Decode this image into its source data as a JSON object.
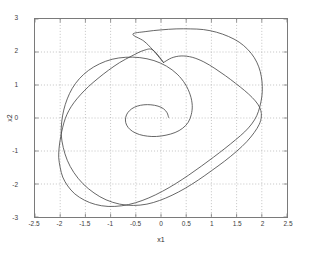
{
  "figure": {
    "background_color": "#ffffff",
    "axes_color": "#7a7a7a",
    "grid_color": "#9a9a9a",
    "curve_color": "#4a4a4a",
    "text_color": "#3c3c3c"
  },
  "chart_data": {
    "type": "line",
    "title": "",
    "xlabel": "x1",
    "ylabel": "x2",
    "xlim": [
      -2.5,
      2.5
    ],
    "ylim": [
      -3,
      3
    ],
    "xticks": [
      -2.5,
      -2,
      -1.5,
      -1,
      -0.5,
      0,
      0.5,
      1,
      1.5,
      2,
      2.5
    ],
    "xtick_labels": [
      "-2.5",
      "-2",
      "-1.5",
      "-1",
      "-0.5",
      "0",
      "0.5",
      "1",
      "1.5",
      "2",
      "2.5"
    ],
    "yticks": [
      -3,
      -2,
      -1,
      0,
      1,
      2,
      3
    ],
    "ytick_labels": [
      "-3",
      "-2",
      "-1",
      "0",
      "1",
      "2",
      "3"
    ],
    "grid": true,
    "grid_style": "dotted",
    "legend": null,
    "legend_position": "none",
    "series": [
      {
        "name": "trajectory-spiral-outward",
        "comment": "Single trajectory starting near (0.15, 0), spiralling counter-clockwise outward onto the limit cycle.",
        "points": [
          [
            0.15,
            0.02
          ],
          [
            0.12,
            0.16
          ],
          [
            0.05,
            0.28
          ],
          [
            -0.06,
            0.36
          ],
          [
            -0.2,
            0.4
          ],
          [
            -0.34,
            0.4
          ],
          [
            -0.47,
            0.36
          ],
          [
            -0.58,
            0.28
          ],
          [
            -0.66,
            0.16
          ],
          [
            -0.7,
            0.02
          ],
          [
            -0.7,
            -0.14
          ],
          [
            -0.65,
            -0.29
          ],
          [
            -0.56,
            -0.41
          ],
          [
            -0.43,
            -0.5
          ],
          [
            -0.27,
            -0.55
          ],
          [
            -0.09,
            -0.56
          ],
          [
            0.1,
            -0.52
          ],
          [
            0.28,
            -0.44
          ],
          [
            0.43,
            -0.31
          ],
          [
            0.54,
            -0.13
          ],
          [
            0.6,
            0.1
          ],
          [
            0.62,
            0.38
          ],
          [
            0.58,
            0.7
          ],
          [
            0.48,
            1.03
          ],
          [
            0.32,
            1.33
          ],
          [
            0.11,
            1.57
          ],
          [
            -0.14,
            1.74
          ],
          [
            -0.42,
            1.83
          ],
          [
            -0.7,
            1.84
          ],
          [
            -0.97,
            1.78
          ],
          [
            -1.22,
            1.64
          ],
          [
            -1.44,
            1.44
          ],
          [
            -1.62,
            1.19
          ],
          [
            -1.76,
            0.9
          ],
          [
            -1.86,
            0.58
          ],
          [
            -1.93,
            0.24
          ],
          [
            -1.97,
            -0.12
          ],
          [
            -1.98,
            -0.5
          ],
          [
            -1.94,
            -0.89
          ],
          [
            -1.86,
            -1.28
          ],
          [
            -1.73,
            -1.65
          ],
          [
            -1.55,
            -1.99
          ],
          [
            -1.33,
            -2.27
          ],
          [
            -1.09,
            -2.48
          ],
          [
            -0.82,
            -2.61
          ],
          [
            -0.55,
            -2.65
          ],
          [
            -0.28,
            -2.61
          ],
          [
            -0.03,
            -2.5
          ],
          [
            0.22,
            -2.34
          ],
          [
            0.48,
            -2.13
          ],
          [
            0.74,
            -1.88
          ],
          [
            1.0,
            -1.6
          ],
          [
            1.26,
            -1.31
          ],
          [
            1.5,
            -1.01
          ],
          [
            1.7,
            -0.72
          ],
          [
            1.85,
            -0.44
          ],
          [
            1.95,
            -0.19
          ],
          [
            1.99,
            0.03
          ],
          [
            1.98,
            0.23
          ],
          [
            1.92,
            0.42
          ],
          [
            1.81,
            0.62
          ],
          [
            1.66,
            0.83
          ],
          [
            1.48,
            1.05
          ],
          [
            1.28,
            1.28
          ],
          [
            1.07,
            1.5
          ],
          [
            0.85,
            1.7
          ],
          [
            0.62,
            1.84
          ],
          [
            0.4,
            1.88
          ],
          [
            0.21,
            1.82
          ],
          [
            0.05,
            1.68
          ]
        ]
      },
      {
        "name": "limit-cycle",
        "comment": "Stable closed orbit, roughly spanning x1 in [-2.02, 2.01] and x2 in [-2.68, 2.70].",
        "closed": true,
        "points": [
          [
            0.05,
            1.68
          ],
          [
            -0.16,
            2.06
          ],
          [
            -0.34,
            2.33
          ],
          [
            -0.56,
            2.54
          ],
          [
            -0.3,
            2.62
          ],
          [
            0.0,
            2.67
          ],
          [
            0.3,
            2.7
          ],
          [
            0.58,
            2.7
          ],
          [
            0.84,
            2.68
          ],
          [
            1.1,
            2.6
          ],
          [
            1.34,
            2.47
          ],
          [
            1.55,
            2.3
          ],
          [
            1.72,
            2.08
          ],
          [
            1.85,
            1.83
          ],
          [
            1.94,
            1.55
          ],
          [
            1.99,
            1.26
          ],
          [
            2.01,
            0.95
          ],
          [
            2.0,
            0.64
          ],
          [
            1.96,
            0.34
          ],
          [
            1.9,
            0.07
          ],
          [
            1.8,
            -0.18
          ],
          [
            1.66,
            -0.42
          ],
          [
            1.48,
            -0.66
          ],
          [
            1.27,
            -0.92
          ],
          [
            1.04,
            -1.19
          ],
          [
            0.8,
            -1.46
          ],
          [
            0.55,
            -1.73
          ],
          [
            0.29,
            -1.99
          ],
          [
            0.03,
            -2.22
          ],
          [
            -0.24,
            -2.42
          ],
          [
            -0.51,
            -2.57
          ],
          [
            -0.78,
            -2.66
          ],
          [
            -1.05,
            -2.68
          ],
          [
            -1.3,
            -2.62
          ],
          [
            -1.52,
            -2.49
          ],
          [
            -1.71,
            -2.3
          ],
          [
            -1.85,
            -2.06
          ],
          [
            -1.95,
            -1.79
          ],
          [
            -2.0,
            -1.5
          ],
          [
            -2.03,
            -1.19
          ],
          [
            -2.02,
            -0.88
          ],
          [
            -1.99,
            -0.57
          ],
          [
            -1.95,
            -0.28
          ],
          [
            -1.9,
            -0.02
          ],
          [
            -1.83,
            0.22
          ],
          [
            -1.73,
            0.46
          ],
          [
            -1.6,
            0.7
          ],
          [
            -1.44,
            0.95
          ],
          [
            -1.25,
            1.2
          ],
          [
            -1.04,
            1.45
          ],
          [
            -0.82,
            1.68
          ],
          [
            -0.58,
            1.88
          ],
          [
            -0.34,
            2.05
          ],
          [
            -0.16,
            2.06
          ]
        ]
      }
    ]
  }
}
